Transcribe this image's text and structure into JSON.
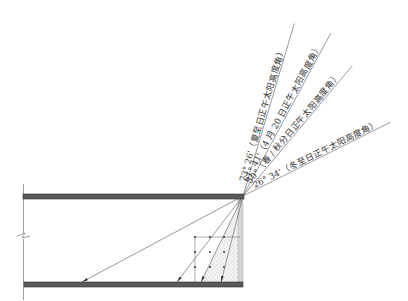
{
  "diagram": {
    "title": "",
    "origin": {
      "x": 243,
      "y": 196
    },
    "floor_y": 282,
    "rays": [
      {
        "id": "summer-solstice",
        "angle_deg": 73.43,
        "label": "73° 26'（夏至日正午太阳高度角）",
        "length": 180,
        "floor_x": 221
      },
      {
        "id": "april-20",
        "angle_deg": 61.68,
        "label": "61° 41'（4 月 20 日正午太阳高度角）",
        "length": 185,
        "floor_x": 201
      },
      {
        "id": "equinox",
        "angle_deg": 50.0,
        "label": "50°（春 / 秋分日正午太阳高度角）",
        "length": 170,
        "floor_x": 177
      },
      {
        "id": "winter-solstice",
        "angle_deg": 26.57,
        "label": "26° 34'（冬至日正午太阳高度角）",
        "length": 165,
        "floor_x": 82
      }
    ],
    "grid": {
      "xs": [
        195,
        210,
        224
      ],
      "ys": [
        237,
        252,
        267
      ],
      "right_x": 240
    },
    "colors": {
      "slab": "#5a5a5a",
      "slab_edge": "#2e2e2e",
      "wall": "#d6d6d6",
      "ray": "#555555",
      "speckle": "#e6e6e6",
      "text": "#333333"
    }
  }
}
